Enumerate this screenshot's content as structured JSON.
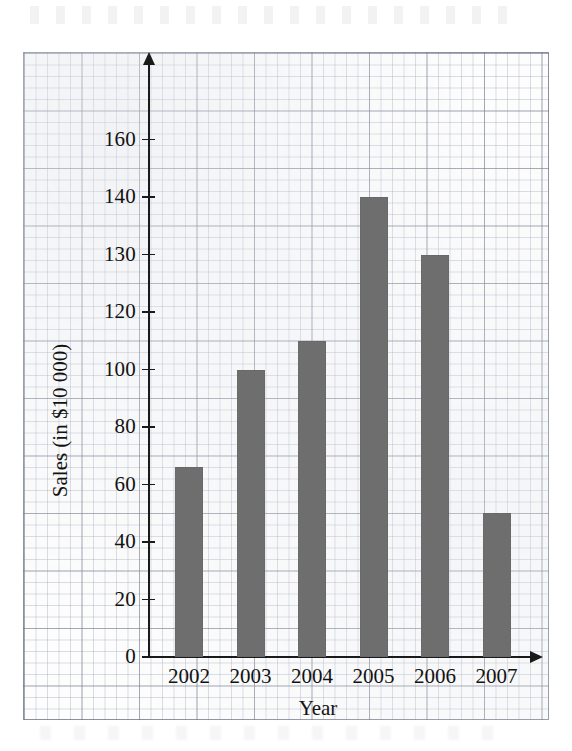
{
  "chart_data": {
    "type": "bar",
    "title": "",
    "xlabel": "Year",
    "ylabel": "Sales (in $10 000)",
    "categories": [
      "2002",
      "2003",
      "2004",
      "2005",
      "2006",
      "2007"
    ],
    "values": [
      66,
      100,
      110,
      160,
      140,
      50
    ],
    "bar_color": "#6e6e6e",
    "ylim": [
      0,
      170
    ],
    "ytick_labels": [
      "0",
      "20",
      "40",
      "60",
      "80",
      "100",
      "120",
      "130",
      "140",
      "160"
    ],
    "ytick_positions": [
      0,
      20,
      40,
      60,
      80,
      100,
      120,
      140,
      160,
      180
    ],
    "grid": true,
    "grid_style": "graph-paper",
    "legend": "none",
    "annotations": []
  },
  "axes": {
    "y_title": "Sales (in $10 000)",
    "x_title": "Year",
    "y_ticks": [
      {
        "label": "0",
        "plot_value": 0
      },
      {
        "label": "20",
        "plot_value": 20
      },
      {
        "label": "40",
        "plot_value": 40
      },
      {
        "label": "60",
        "plot_value": 60
      },
      {
        "label": "80",
        "plot_value": 80
      },
      {
        "label": "100",
        "plot_value": 100
      },
      {
        "label": "120",
        "plot_value": 120
      },
      {
        "label": "130",
        "plot_value": 140
      },
      {
        "label": "140",
        "plot_value": 160
      },
      {
        "label": "160",
        "plot_value": 180
      }
    ],
    "x_ticks": [
      "2002",
      "2003",
      "2004",
      "2005",
      "2006",
      "2007"
    ]
  },
  "bars": [
    {
      "category": "2002",
      "value": 66
    },
    {
      "category": "2003",
      "value": 100
    },
    {
      "category": "2004",
      "value": 110
    },
    {
      "category": "2005",
      "value": 160
    },
    {
      "category": "2006",
      "value": 140
    },
    {
      "category": "2007",
      "value": 50
    }
  ]
}
